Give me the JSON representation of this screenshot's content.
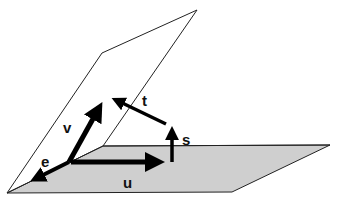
{
  "diagram": {
    "type": "vector-planes",
    "colors": {
      "background": "#ffffff",
      "horizontal_plane_fill": "#cfcfcf",
      "plane_stroke": "#222222",
      "arrow": "#000000"
    },
    "planes": [
      {
        "name": "horizontal-plane",
        "shaded": true
      },
      {
        "name": "tilted-plane",
        "shaded": false
      }
    ],
    "vectors": [
      {
        "name": "e",
        "label": "e"
      },
      {
        "name": "v",
        "label": "v"
      },
      {
        "name": "u",
        "label": "u"
      },
      {
        "name": "s",
        "label": "s"
      },
      {
        "name": "t",
        "label": "t"
      }
    ]
  }
}
